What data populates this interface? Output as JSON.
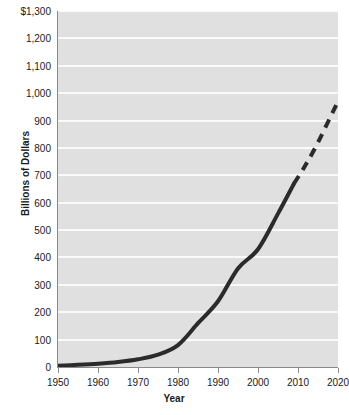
{
  "chart_data": {
    "type": "line",
    "title": "",
    "xlabel": "Year",
    "ylabel": "Billions of Dollars",
    "xlim": [
      1950,
      2020
    ],
    "ylim": [
      0,
      1300
    ],
    "grid": true,
    "legend": "none",
    "x_ticks": [
      "1950",
      "1960",
      "1970",
      "1980",
      "1990",
      "2000",
      "2010",
      "2020"
    ],
    "x_tick_values": [
      1950,
      1960,
      1970,
      1980,
      1990,
      2000,
      2010,
      2020
    ],
    "y_ticks": [
      "0",
      "100",
      "200",
      "300",
      "400",
      "500",
      "600",
      "700",
      "800",
      "900",
      "1,000",
      "1,100",
      "1,200",
      "$1,300"
    ],
    "y_tick_values": [
      0,
      100,
      200,
      300,
      400,
      500,
      600,
      700,
      800,
      900,
      1000,
      1100,
      1200,
      1300
    ],
    "series": [
      {
        "name": "Actual",
        "style": "solid",
        "color": "#2b2b2b",
        "x": [
          1950,
          1955,
          1960,
          1965,
          1970,
          1975,
          1980,
          1985,
          1990,
          1995,
          2000,
          2005,
          2009
        ],
        "values": [
          5,
          8,
          12,
          18,
          28,
          45,
          80,
          160,
          240,
          360,
          430,
          560,
          670
        ]
      },
      {
        "name": "Projected",
        "style": "dashed",
        "color": "#2b2b2b",
        "x": [
          2009,
          2012,
          2015,
          2018,
          2020
        ],
        "values": [
          670,
          740,
          820,
          910,
          970
        ]
      }
    ],
    "annotations": [
      "Solid line shows historical values through about 2009",
      "Dashed line shows projection from about 2009 to 2020"
    ],
    "colors": {
      "plot_background": "#e0e0e0",
      "gridline": "#fafafa",
      "axis": "#8a8a8a",
      "line": "#2b2b2b",
      "text": "#1a1a1a",
      "page_background": "#ffffff"
    }
  }
}
